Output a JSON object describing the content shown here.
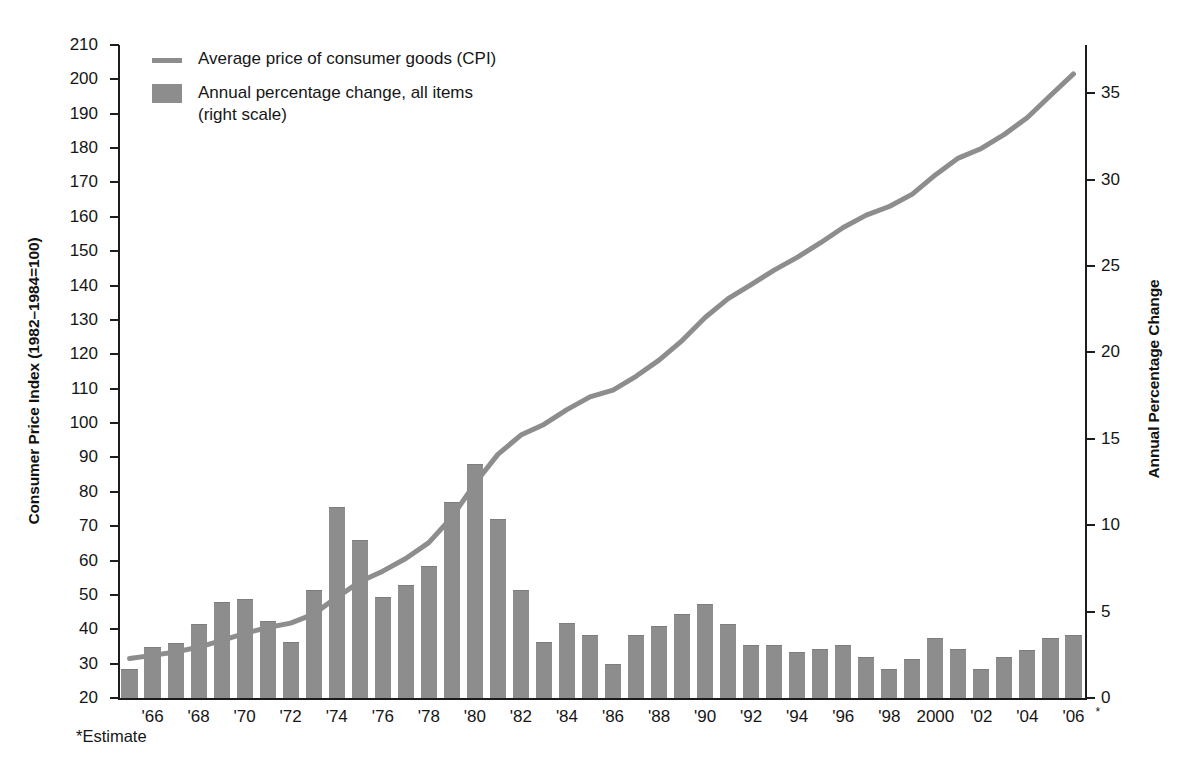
{
  "chart_data": {
    "type": "bar",
    "title": "",
    "xlabel": "",
    "ylabel": "Consumer Price Index (1982–1984=100)",
    "y2label": "Annual Percentage Change",
    "ylim": [
      20,
      210
    ],
    "y2lim": [
      0,
      37.8
    ],
    "grid": false,
    "legend_position": "top-left",
    "x_start_year": 1965,
    "x_end_year": 2006,
    "categories": [
      "1965",
      "1966",
      "1967",
      "1968",
      "1969",
      "1970",
      "1971",
      "1972",
      "1973",
      "1974",
      "1975",
      "1976",
      "1977",
      "1978",
      "1979",
      "1980",
      "1981",
      "1982",
      "1983",
      "1984",
      "1985",
      "1986",
      "1987",
      "1988",
      "1989",
      "1990",
      "1991",
      "1992",
      "1993",
      "1994",
      "1995",
      "1996",
      "1997",
      "1998",
      "1999",
      "2000",
      "2001",
      "2002",
      "2003",
      "2004",
      "2005",
      "2006"
    ],
    "x_tick_labels": [
      "'66",
      "'68",
      "'70",
      "'72",
      "'74",
      "'76",
      "'78",
      "'80",
      "'82",
      "'84",
      "'86",
      "'88",
      "'90",
      "'92",
      "'94",
      "'96",
      "'98",
      "2000",
      "'02",
      "'04",
      "'06"
    ],
    "x_tick_years": [
      1966,
      1968,
      1970,
      1972,
      1974,
      1976,
      1978,
      1980,
      1982,
      1984,
      1986,
      1988,
      1990,
      1992,
      1994,
      1996,
      1998,
      2000,
      2002,
      2004,
      2006
    ],
    "y_tick_labels": [
      "210",
      "200",
      "190",
      "180",
      "170",
      "160",
      "150",
      "140",
      "130",
      "120",
      "110",
      "100",
      "90",
      "80",
      "70",
      "60",
      "50",
      "40",
      "30",
      "20"
    ],
    "y_tick_values": [
      210,
      200,
      190,
      180,
      170,
      160,
      150,
      140,
      130,
      120,
      110,
      100,
      90,
      80,
      70,
      60,
      50,
      40,
      30,
      20
    ],
    "y2_tick_labels": [
      "35",
      "30",
      "25",
      "20",
      "15",
      "10",
      "5",
      "0"
    ],
    "y2_tick_values": [
      35,
      30,
      25,
      20,
      15,
      10,
      5,
      0
    ],
    "series": [
      {
        "name": "Annual percentage change, all items (right scale)",
        "type": "bar",
        "axis": "right",
        "color": "#8d8d8d",
        "values": [
          1.6,
          2.9,
          3.1,
          4.2,
          5.5,
          5.7,
          4.4,
          3.2,
          6.2,
          11.0,
          9.1,
          5.8,
          6.5,
          7.6,
          11.3,
          13.5,
          10.3,
          6.2,
          3.2,
          4.3,
          3.6,
          1.9,
          3.6,
          4.1,
          4.8,
          5.4,
          4.2,
          3.0,
          3.0,
          2.6,
          2.8,
          3.0,
          2.3,
          1.6,
          2.2,
          3.4,
          2.8,
          1.6,
          2.3,
          2.7,
          3.4,
          3.6
        ]
      },
      {
        "name": "Average price of consumer goods (CPI)",
        "type": "line",
        "axis": "left",
        "color": "#8d8d8d",
        "values": [
          31.5,
          32.4,
          33.4,
          34.8,
          36.7,
          38.8,
          40.5,
          41.8,
          44.4,
          49.3,
          53.8,
          56.9,
          60.6,
          65.2,
          72.6,
          82.4,
          90.9,
          96.5,
          99.6,
          103.9,
          107.6,
          109.6,
          113.6,
          118.3,
          124.0,
          130.7,
          136.2,
          140.3,
          144.5,
          148.2,
          152.4,
          156.9,
          160.5,
          163.0,
          166.6,
          172.2,
          177.1,
          179.9,
          184.0,
          188.9,
          195.3,
          201.6
        ]
      }
    ],
    "footnote": "*Estimate",
    "footnote_marker": "*",
    "estimate_year_label": "'06"
  },
  "legend": {
    "items": [
      {
        "marker": "line-swatch",
        "label": "Average price of consumer goods (CPI)"
      },
      {
        "marker": "box-swatch",
        "label_line1": "Annual percentage change, all items",
        "label_line2": "(right scale)"
      }
    ]
  },
  "colors": {
    "bar": "#8d8d8d",
    "line": "#8d8d8d",
    "axis": "#1d1d1d",
    "text": "#161616",
    "background": "#ffffff"
  }
}
